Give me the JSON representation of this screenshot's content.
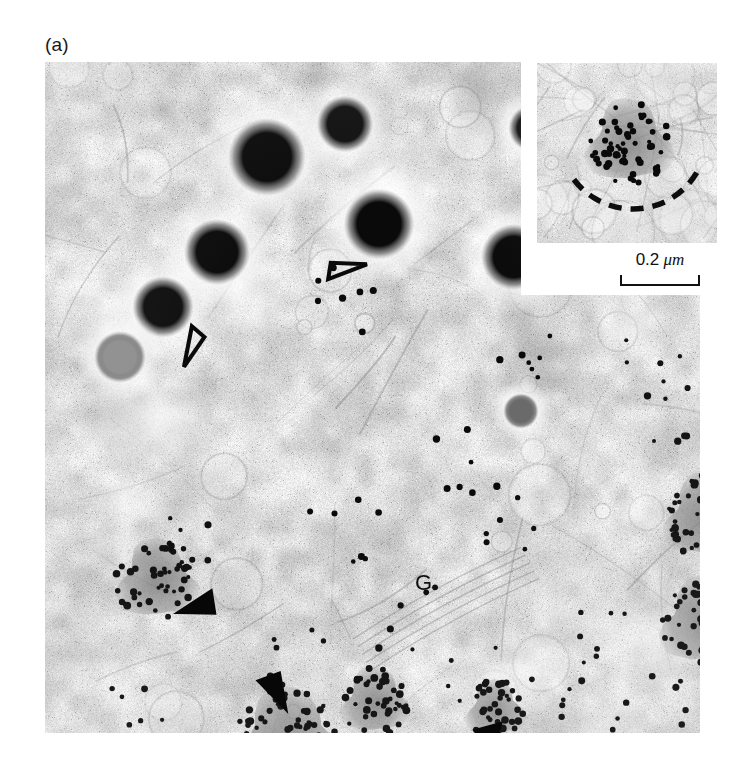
{
  "figure": {
    "panel_label": "(a)",
    "type": "electron-micrograph"
  },
  "main_image": {
    "name": "main-micrograph",
    "x": 45,
    "y": 62,
    "width": 655,
    "height": 671,
    "background_tone": "#e9e9e9",
    "structures": {
      "dense_cores": [
        {
          "cx": 222,
          "cy": 95,
          "r": 33,
          "tone": "#0b0b0b"
        },
        {
          "cx": 172,
          "cy": 190,
          "r": 28,
          "tone": "#0d0d0d"
        },
        {
          "cx": 118,
          "cy": 245,
          "r": 26,
          "tone": "#101010"
        },
        {
          "cx": 334,
          "cy": 162,
          "r": 30,
          "tone": "#0a0a0a"
        },
        {
          "cx": 469,
          "cy": 195,
          "r": 28,
          "tone": "#0c0c0c"
        },
        {
          "cx": 300,
          "cy": 62,
          "r": 24,
          "tone": "#111111"
        },
        {
          "cx": 487,
          "cy": 66,
          "r": 20,
          "tone": "#151515"
        },
        {
          "cx": 476,
          "cy": 349,
          "r": 15,
          "tone": "#6a6a6a"
        },
        {
          "cx": 75,
          "cy": 295,
          "r": 22,
          "tone": "#8f8f8f"
        }
      ],
      "gold_labelled_granules": [
        {
          "cx": 112,
          "cy": 519,
          "r": 42,
          "particles": 46,
          "name": "granule-left"
        },
        {
          "cx": 243,
          "cy": 681,
          "r": 55,
          "particles": 78,
          "name": "granule-bottom-left"
        },
        {
          "cx": 330,
          "cy": 640,
          "r": 35,
          "particles": 44,
          "name": "granule-bottom-mid"
        },
        {
          "cx": 450,
          "cy": 648,
          "r": 30,
          "particles": 38,
          "name": "granule-bottom-arrowed"
        },
        {
          "cx": 662,
          "cy": 455,
          "r": 44,
          "particles": 62,
          "name": "granule-right-upper"
        },
        {
          "cx": 660,
          "cy": 560,
          "r": 46,
          "particles": 66,
          "name": "granule-right-lower"
        }
      ],
      "scattered_gold_count": 120
    }
  },
  "inset": {
    "name": "inset-micrograph",
    "x": 537,
    "y": 63,
    "width": 180,
    "height": 180,
    "granule": {
      "cx": 92,
      "cy": 80,
      "r": 44,
      "particles": 58
    },
    "dashed_arc": {
      "label": "dashed-membrane-arc",
      "dashes": 7
    }
  },
  "scale_bar": {
    "value": "0.2",
    "unit": "μm",
    "text": "0.2 μm",
    "bar_length_px": 80
  },
  "annotations": [
    {
      "id": "open-arrowhead-1",
      "type": "open-arrowhead",
      "label": "",
      "x": 300,
      "y": 203,
      "rotation": 28,
      "size": 34
    },
    {
      "id": "open-arrowhead-2",
      "type": "open-arrowhead",
      "label": "",
      "x": 150,
      "y": 286,
      "rotation": 150,
      "size": 34
    },
    {
      "id": "filled-arrowhead-1",
      "type": "filled-arrowhead",
      "label": "",
      "x": 156,
      "y": 549,
      "rotation": 196,
      "size": 36
    },
    {
      "id": "filled-arrowhead-2",
      "type": "filled-arrowhead",
      "label": "",
      "x": 235,
      "y": 625,
      "rotation": 95,
      "size": 36
    },
    {
      "id": "solid-arrow",
      "type": "arrow",
      "label": "",
      "x": 426,
      "y": 683,
      "rotation": -44,
      "size": 52
    },
    {
      "id": "golgi-label",
      "type": "text",
      "label": "G",
      "x": 370,
      "y": 508
    }
  ],
  "colors": {
    "ink": "#111111",
    "page": "#ffffff",
    "film_light": "#efefef",
    "film_mid": "#cfcfcf",
    "film_dark": "#7a7a7a",
    "gold_particle": "#0a0a0a"
  }
}
